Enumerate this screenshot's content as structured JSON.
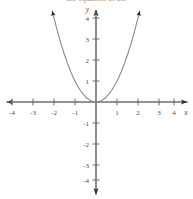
{
  "figure": {
    "width": 193,
    "height": 199,
    "background_color": "#ffffff",
    "clipped_caption_text": "the equation of the"
  },
  "axes": {
    "origin_px": {
      "x": 96,
      "y": 102
    },
    "unit_px": 21,
    "axis_color": "#6e6e6e",
    "tick_color": "#6e6e6e",
    "label_color": "#4a4a4a",
    "x_axis_label": "x",
    "y_axis_label": "y",
    "x_tick_labels": [
      "-4",
      "-3",
      "-2",
      "-1",
      "1",
      "2",
      "3",
      "4"
    ],
    "x_tick_values": [
      -4,
      -3,
      -2,
      -1,
      1,
      2,
      3,
      4
    ],
    "y_tick_labels": [
      "4",
      "3",
      "2",
      "1",
      "-1",
      "-2",
      "-3",
      "-4"
    ],
    "y_tick_values": [
      4,
      3,
      2,
      1,
      -1,
      -2,
      -3,
      -4
    ],
    "arrowheads": [
      "x-left",
      "x-right",
      "y-top",
      "y-bottom"
    ]
  },
  "chart_data": {
    "type": "line",
    "title": "",
    "subtitle": "",
    "xlabel": "x",
    "ylabel": "y",
    "xlim": [
      -4.6,
      4.6
    ],
    "ylim": [
      -4.6,
      4.6
    ],
    "grid": false,
    "legend_position": "none",
    "annotations": [],
    "series": [
      {
        "name": "y = x^2",
        "equation": "y = x^2",
        "vertex": [
          0,
          0
        ],
        "color": "#8a8a8a",
        "line_width": 1.1,
        "arrow_ends": [
          "left",
          "right"
        ],
        "x": [
          -2.08,
          -1.95,
          -1.8,
          -1.65,
          -1.5,
          -1.35,
          -1.2,
          -1.05,
          -0.9,
          -0.75,
          -0.6,
          -0.45,
          -0.3,
          -0.15,
          0,
          0.15,
          0.3,
          0.45,
          0.6,
          0.75,
          0.9,
          1.05,
          1.2,
          1.35,
          1.5,
          1.65,
          1.8,
          1.95,
          2.08
        ],
        "y": [
          4.33,
          3.8,
          3.24,
          2.72,
          2.25,
          1.82,
          1.44,
          1.1,
          0.81,
          0.56,
          0.36,
          0.2,
          0.09,
          0.02,
          0,
          0.02,
          0.09,
          0.2,
          0.36,
          0.56,
          0.81,
          1.1,
          1.44,
          1.82,
          2.25,
          2.72,
          3.24,
          3.8,
          4.33
        ]
      }
    ]
  }
}
